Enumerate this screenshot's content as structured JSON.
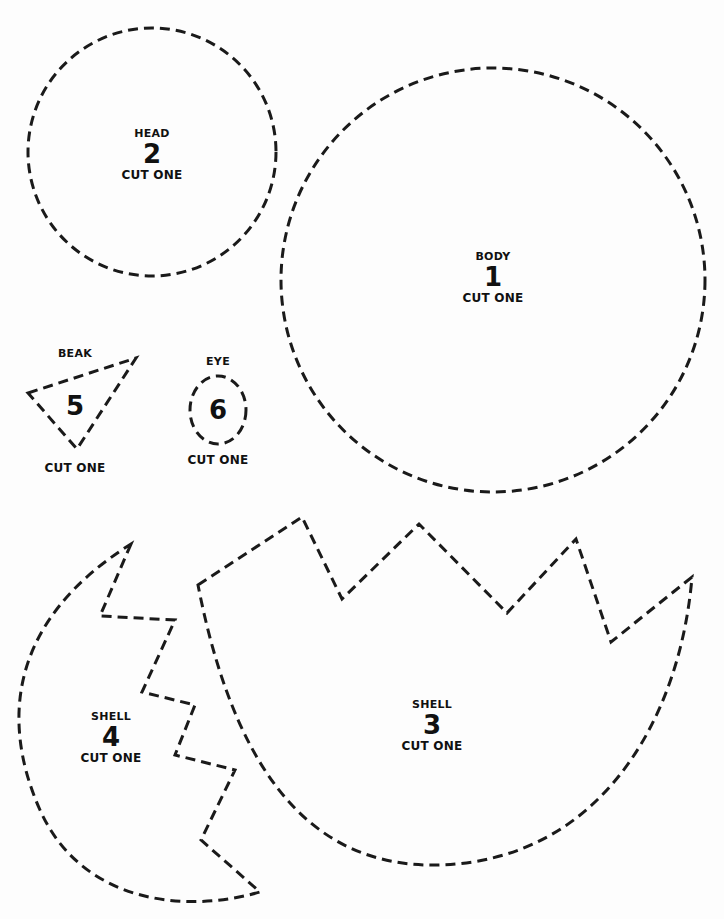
{
  "document": {
    "type": "craft-pattern-template",
    "line_color": "#1a1a1a",
    "background": "#fdfdfd"
  },
  "pieces": {
    "body": {
      "name": "BODY",
      "number": "1",
      "quantity": "CUT ONE"
    },
    "head": {
      "name": "HEAD",
      "number": "2",
      "quantity": "CUT ONE"
    },
    "shell3": {
      "name": "SHELL",
      "number": "3",
      "quantity": "CUT ONE"
    },
    "shell4": {
      "name": "SHELL",
      "number": "4",
      "quantity": "CUT ONE"
    },
    "beak": {
      "name": "BEAK",
      "number": "5",
      "quantity": "CUT ONE"
    },
    "eye": {
      "name": "EYE",
      "number": "6",
      "quantity": "CUT ONE"
    }
  }
}
